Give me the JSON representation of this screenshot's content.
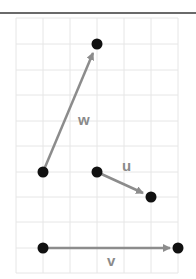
{
  "diagram": {
    "type": "vector-grid",
    "grid": {
      "cols": 6,
      "rows": 10,
      "line_color": "#e6e6e6"
    },
    "colors": {
      "vector": "#8c8c8c",
      "point": "#111111",
      "label": "#8a8a8a",
      "rule": "#6a6a6a"
    },
    "vectors": [
      {
        "name": "w",
        "label": "w",
        "from": [
          1,
          6
        ],
        "to": [
          3,
          1
        ]
      },
      {
        "name": "u",
        "label": "u",
        "from": [
          3,
          6
        ],
        "to": [
          5,
          7
        ]
      },
      {
        "name": "v",
        "label": "v",
        "from": [
          1,
          9
        ],
        "to": [
          6,
          9
        ]
      }
    ]
  }
}
